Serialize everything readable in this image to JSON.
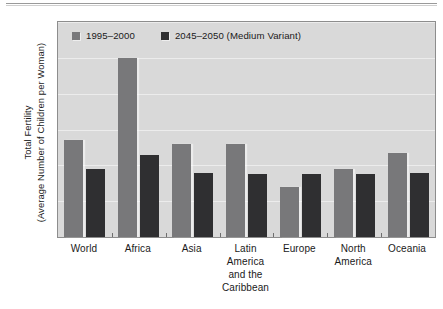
{
  "chart_data": {
    "type": "bar",
    "title": "",
    "xlabel": "",
    "ylabel_line1": "Total Fertility",
    "ylabel_line2": "(Average Number of Children per Woman)",
    "ylim": [
      0,
      6
    ],
    "yticks": [
      "0",
      "1",
      "2",
      "3",
      "4",
      "5",
      "6"
    ],
    "grid": true,
    "legend_position": "top-left",
    "categories": [
      [
        "World"
      ],
      [
        "Africa"
      ],
      [
        "Asia"
      ],
      [
        "Latin",
        "America",
        "and the",
        "Caribbean"
      ],
      [
        "Europe"
      ],
      [
        "North",
        "America"
      ],
      [
        "Oceania"
      ]
    ],
    "series": [
      {
        "name": "1995–2000",
        "color": "#78787a",
        "values": [
          2.7,
          5.0,
          2.6,
          2.6,
          1.4,
          1.9,
          2.35
        ]
      },
      {
        "name": "2045–2050 (Medium Variant)",
        "color": "#2f2f31",
        "values": [
          1.9,
          2.3,
          1.8,
          1.75,
          1.75,
          1.75,
          1.8
        ]
      }
    ]
  }
}
